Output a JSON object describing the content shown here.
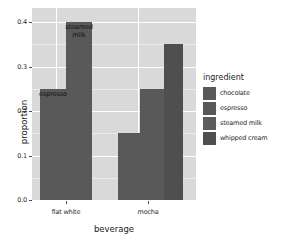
{
  "chart_data": {
    "type": "bar",
    "title": "",
    "subtitle": "",
    "xlabel": "beverage",
    "ylabel": "proportion",
    "categories": [
      "flat white",
      "mocha"
    ],
    "ytick_labels": [
      "0.0",
      "0.1",
      "0.2",
      "0.3",
      "0.4"
    ],
    "ytick_values": [
      0.0,
      0.1,
      0.2,
      0.3,
      0.4
    ],
    "ylim": [
      0.0,
      0.42
    ],
    "grid": "horizontal and vertical white gridlines on grey panel",
    "legend_position": "right",
    "legend_title": "ingredient",
    "series": [
      {
        "name": "chocolate",
        "values": [
          0.0,
          0.25
        ]
      },
      {
        "name": "espresso",
        "values": [
          0.25,
          0.15
        ]
      },
      {
        "name": "steamed milk",
        "values": [
          0.4,
          0.0
        ]
      },
      {
        "name": "whipped cream",
        "values": [
          0.0,
          0.35
        ]
      }
    ],
    "annotations": [
      {
        "text": "espresso",
        "beverage": "flat white",
        "value": 0.25
      },
      {
        "text": "steamed milk",
        "beverage": "flat white",
        "value": 0.4
      }
    ],
    "bars": [
      {
        "beverage": "flat white",
        "ingredient": "espresso",
        "value": 0.25,
        "x": 40,
        "width": 26,
        "color": "#595959",
        "label": "espresso",
        "label_lines": [
          "espresso"
        ]
      },
      {
        "beverage": "flat white",
        "ingredient": "steamed milk",
        "value": 0.4,
        "x": 66,
        "width": 26,
        "color": "#595959",
        "label": "steamed milk",
        "label_lines": [
          "steamed",
          "milk"
        ]
      },
      {
        "beverage": "mocha",
        "ingredient": "espresso",
        "value": 0.15,
        "x": 118,
        "width": 22,
        "color": "#595959",
        "label": "",
        "label_lines": []
      },
      {
        "beverage": "mocha",
        "ingredient": "chocolate",
        "value": 0.25,
        "x": 140,
        "width": 24,
        "color": "#595959",
        "label": "",
        "label_lines": []
      },
      {
        "beverage": "mocha",
        "ingredient": "whipped cream",
        "value": 0.35,
        "x": 164,
        "width": 19,
        "color": "#4f4f4f",
        "label": "",
        "label_lines": []
      }
    ]
  },
  "legend": {
    "title": "ingredient",
    "items": [
      {
        "label": "chocolate",
        "color": "#595959"
      },
      {
        "label": "espresso",
        "color": "#595959"
      },
      {
        "label": "steamed milk",
        "color": "#5d5d5d"
      },
      {
        "label": "whipped cream",
        "color": "#4f4f4f"
      }
    ]
  },
  "axes": {
    "y_title": "proportion",
    "x_title": "beverage",
    "y_ticks": [
      "0.4",
      "0.3",
      "0.2",
      "0.1",
      "0.0"
    ],
    "x_ticks": [
      "flat white",
      "mocha"
    ]
  },
  "theme": {
    "panel_background": "#d9d9d9",
    "grid_major": "#ffffff",
    "grid_minor": "#ececec",
    "plot_background": "#ffffff",
    "bar_fill": "#595959"
  }
}
